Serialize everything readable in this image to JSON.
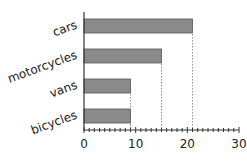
{
  "chart_data": {
    "type": "bar",
    "orientation": "horizontal",
    "title": "",
    "xlabel": "",
    "ylabel": "",
    "categories": [
      "cars",
      "motorcycles",
      "vans",
      "bicycles"
    ],
    "values": [
      21,
      15,
      9,
      9
    ],
    "xlim": [
      0,
      30
    ],
    "x_ticks": [
      0,
      10,
      20,
      30
    ],
    "minor_tick_step": 1,
    "grid": false,
    "reference_lines": "dotted vertical lines drop from each bar end to the x-axis",
    "bar_color": "#8a8a8a",
    "bar_edge_color": "#555555",
    "legend": null
  }
}
